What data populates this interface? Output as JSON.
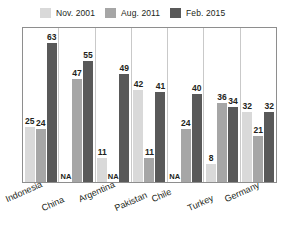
{
  "chart_data": {
    "type": "bar",
    "title": "",
    "subtitle": "",
    "xlabel": "",
    "ylabel": "",
    "ylim": [
      0,
      70
    ],
    "grid": false,
    "legend_position": "top",
    "categories": [
      "Indonesia",
      "China",
      "Argentina",
      "Pakistan",
      "Chile",
      "Turkey",
      "Germany"
    ],
    "series": [
      {
        "name": "Nov. 2001",
        "color": "#d9d9d9",
        "values": [
          25,
          null,
          11,
          42,
          null,
          8,
          32
        ],
        "labels": [
          "25",
          "NA",
          "11",
          "42",
          "NA",
          "8",
          "32"
        ]
      },
      {
        "name": "Aug. 2011",
        "color": "#a6a6a6",
        "values": [
          24,
          47,
          null,
          11,
          24,
          36,
          21
        ],
        "labels": [
          "24",
          "47",
          "NA",
          "11",
          "24",
          "36",
          "21"
        ]
      },
      {
        "name": "Feb. 2015",
        "color": "#595959",
        "values": [
          63,
          55,
          49,
          41,
          40,
          34,
          32
        ],
        "labels": [
          "63",
          "55",
          "49",
          "41",
          "40",
          "34",
          "32"
        ]
      }
    ],
    "na_text": "NA"
  },
  "legend": {
    "items": [
      {
        "label": "Nov. 2001",
        "color": "#d9d9d9"
      },
      {
        "label": "Aug. 2011",
        "color": "#a6a6a6"
      },
      {
        "label": "Feb. 2015",
        "color": "#595959"
      }
    ]
  },
  "colors": {
    "series_1": "#d9d9d9",
    "series_2": "#a6a6a6",
    "series_3": "#595959",
    "frame": "#8e8e8e",
    "separator": "#c9c9c9",
    "text": "#231f20",
    "background": "#ffffff"
  }
}
